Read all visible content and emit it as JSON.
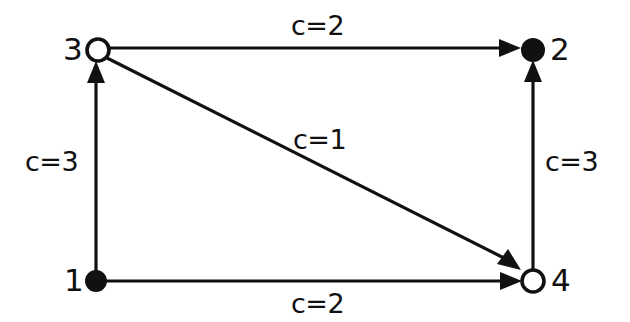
{
  "diagram": {
    "background_color": "#ffffff",
    "stroke_color": "#111111",
    "width": 630,
    "height": 322,
    "nodes": [
      {
        "id": "3",
        "label": "3",
        "x": 98,
        "y": 50,
        "radius": 11,
        "style": "hollow",
        "label_side": "left"
      },
      {
        "id": "2",
        "label": "2",
        "x": 533,
        "y": 50,
        "radius": 11,
        "style": "filled",
        "label_side": "right"
      },
      {
        "id": "1",
        "label": "1",
        "x": 96,
        "y": 281,
        "radius": 10,
        "style": "filled",
        "label_side": "left"
      },
      {
        "id": "4",
        "label": "4",
        "x": 533,
        "y": 281,
        "radius": 11,
        "style": "hollow",
        "label_side": "right"
      }
    ],
    "edges": [
      {
        "id": "e-3-2",
        "from": "3",
        "to": "2",
        "label": "c=2",
        "orientation": "horizontal-top",
        "directed": true
      },
      {
        "id": "e-1-3",
        "from": "1",
        "to": "3",
        "label": "c=3",
        "orientation": "vertical-left",
        "directed": true
      },
      {
        "id": "e-3-4",
        "from": "3",
        "to": "4",
        "label": "c=1",
        "orientation": "diagonal",
        "directed": true
      },
      {
        "id": "e-4-2",
        "from": "4",
        "to": "2",
        "label": "c=3",
        "orientation": "vertical-right",
        "directed": true
      },
      {
        "id": "e-1-4",
        "from": "1",
        "to": "4",
        "label": "c=2",
        "orientation": "horizontal-bottom",
        "directed": true
      }
    ],
    "labels": {
      "node_3": "3",
      "node_2": "2",
      "node_1": "1",
      "node_4": "4",
      "cost_top": "c=2",
      "cost_left": "c=3",
      "cost_diagonal": "c=1",
      "cost_right": "c=3",
      "cost_bottom": "c=2"
    }
  }
}
